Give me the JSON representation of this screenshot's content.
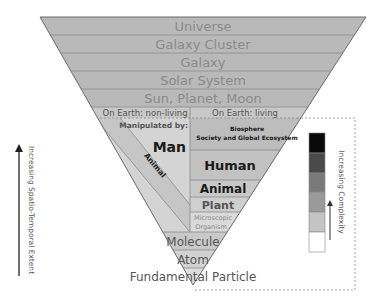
{
  "diagram": {
    "levels_top": [
      {
        "label": "Universe"
      },
      {
        "label": "Galaxy Cluster"
      },
      {
        "label": "Galaxy"
      },
      {
        "label": "Solar System"
      },
      {
        "label": "Sun, Planet, Moon"
      }
    ],
    "earth_split": {
      "non_living_label": "On Earth: non-living",
      "living_label": "On Earth: living",
      "manipulated_by_label": "Manipulated by:",
      "man_label": "Man",
      "animal_diag_label": "Animal"
    },
    "living_levels": [
      {
        "label": "Biosphere",
        "sublabel": "Society and Global Ecosystem"
      },
      {
        "label": "Human"
      },
      {
        "label": "Animal"
      },
      {
        "label": "Plant"
      },
      {
        "label": "Microscopic",
        "sublabel": "Organism"
      }
    ],
    "levels_bottom": [
      {
        "label": "Molecule"
      },
      {
        "label": "Atom"
      },
      {
        "label": "Fundamental Particle"
      }
    ],
    "left_axis_label": "Increasing Spatio-Temporal Extent",
    "legend": {
      "label": "Increasing Complexity",
      "swatches": [
        "#0a0a0a",
        "#4a4a4a",
        "#7a7a7a",
        "#9a9a9a",
        "#c4c4c4",
        "#ffffff"
      ]
    },
    "colors": {
      "band_fill": "#b9b9b9",
      "band_line": "#8c8c8c",
      "light_fill": "#d2d2d2",
      "lighter_fill": "#e4e4e4"
    }
  }
}
